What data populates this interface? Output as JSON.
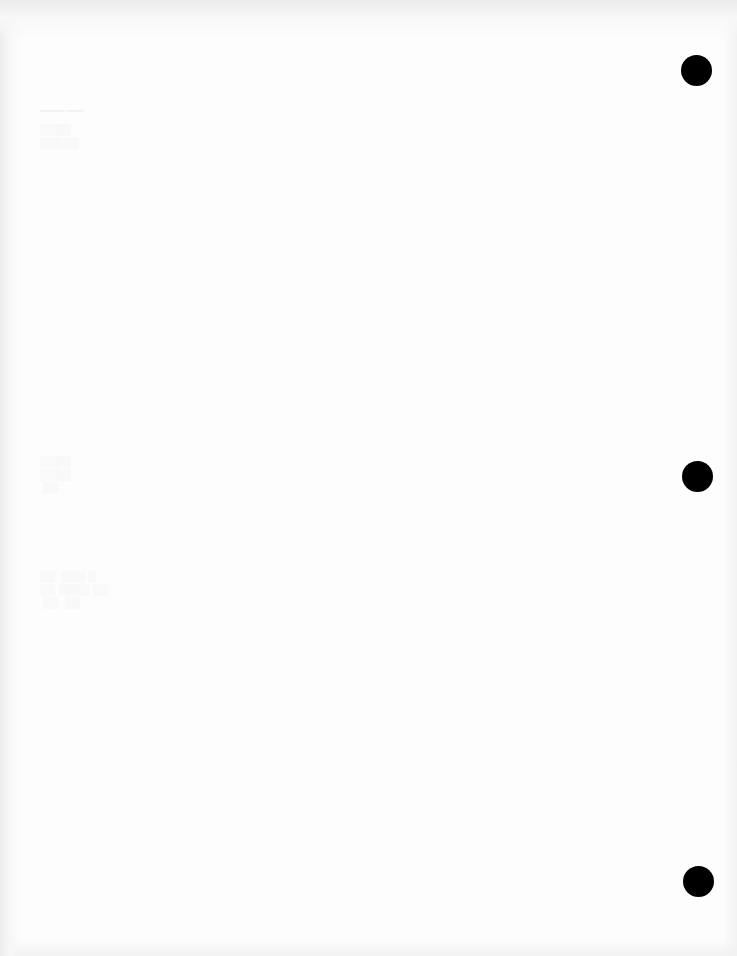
{
  "page": {
    "type": "blank scanned sheet",
    "background_color": "#fdfdfd",
    "edge_shadow_color": "#ececec"
  },
  "punch_holes": [
    {
      "cx": 696,
      "cy": 70,
      "r": 15,
      "color": "#000000"
    },
    {
      "cx": 697,
      "cy": 476,
      "r": 15,
      "color": "#000000"
    },
    {
      "cx": 698,
      "cy": 881,
      "r": 15,
      "color": "#000000"
    }
  ],
  "bleed_through_marks": [
    {
      "x": 40,
      "y": 105,
      "w": 80,
      "h": 75
    },
    {
      "x": 40,
      "y": 450,
      "w": 65,
      "h": 60
    },
    {
      "x": 40,
      "y": 565,
      "w": 130,
      "h": 60
    }
  ]
}
